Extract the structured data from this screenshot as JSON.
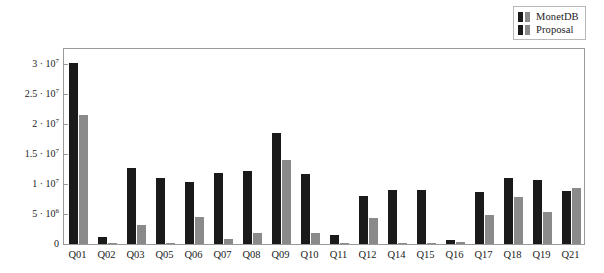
{
  "chart": {
    "type": "bar",
    "title": "",
    "ylabel": "Number of read blocks",
    "xlabel": ""
  },
  "legend": {
    "position": "top-right",
    "entries": [
      {
        "label": "MonetDB",
        "color": "#1a1a1a"
      },
      {
        "label": "Proposal",
        "color": "#8a8a8a"
      }
    ]
  },
  "yaxis": {
    "ticks": [
      {
        "value": 0,
        "label": "0",
        "mantissa": "0",
        "exponent": ""
      },
      {
        "value": 5000000,
        "label": "5 · 10^6",
        "mantissa": "5 · 10",
        "exponent": "6"
      },
      {
        "value": 10000000,
        "label": "1 · 10^7",
        "mantissa": "1 · 10",
        "exponent": "7"
      },
      {
        "value": 15000000,
        "label": "1.5 · 10^7",
        "mantissa": "1.5 · 10",
        "exponent": "7"
      },
      {
        "value": 20000000,
        "label": "2 · 10^7",
        "mantissa": "2 · 10",
        "exponent": "7"
      },
      {
        "value": 25000000,
        "label": "2.5 · 10^7",
        "mantissa": "2.5 · 10",
        "exponent": "7"
      },
      {
        "value": 30000000,
        "label": "3 · 10^7",
        "mantissa": "3 · 10",
        "exponent": "7"
      }
    ],
    "min": 0,
    "max": 32500000,
    "grid": false
  },
  "chart_data": {
    "type": "bar",
    "title": "",
    "xlabel": "",
    "ylabel": "Number of read blocks",
    "ylim": [
      0,
      32500000
    ],
    "grid": false,
    "legend_position": "top-right",
    "categories": [
      "Q01",
      "Q02",
      "Q03",
      "Q05",
      "Q06",
      "Q07",
      "Q08",
      "Q09",
      "Q10",
      "Q11",
      "Q12",
      "Q14",
      "Q15",
      "Q16",
      "Q17",
      "Q18",
      "Q19",
      "Q21"
    ],
    "series": [
      {
        "name": "MonetDB",
        "color": "#1a1a1a",
        "values": [
          30200000,
          1200000,
          12600000,
          11000000,
          10300000,
          11900000,
          12100000,
          18500000,
          11600000,
          1500000,
          8000000,
          9000000,
          9000000,
          700000,
          8700000,
          11000000,
          10700000,
          8900000
        ]
      },
      {
        "name": "Proposal",
        "color": "#8a8a8a",
        "values": [
          21500000,
          250000,
          3100000,
          150000,
          4500000,
          900000,
          1800000,
          14000000,
          1900000,
          100000,
          4400000,
          200000,
          150000,
          350000,
          4900000,
          7900000,
          5300000,
          9400000
        ]
      }
    ]
  }
}
